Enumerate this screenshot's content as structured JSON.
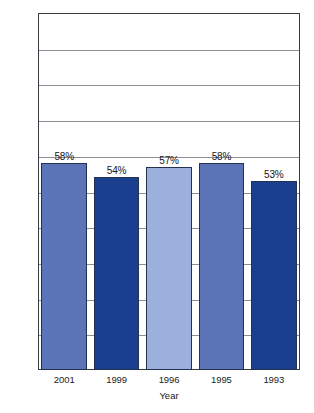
{
  "chart_data": {
    "type": "bar",
    "title": "",
    "xlabel": "Year",
    "ylabel": "",
    "categories": [
      "2001",
      "1999",
      "1996",
      "1995",
      "1993"
    ],
    "values": [
      58,
      54,
      57,
      58,
      53
    ],
    "data_labels": [
      "58%",
      "54%",
      "57%",
      "58%",
      "53%"
    ],
    "bar_colors": [
      "#5B74B8",
      "#1B3F8F",
      "#9CB0DE",
      "#5B74B8",
      "#1B3F8F"
    ],
    "ylim": [
      0,
      100
    ],
    "ytick_labels": [
      "0%",
      "10%",
      "20%",
      "30%",
      "40%",
      "50%",
      "60%",
      "70%",
      "80%",
      "90%",
      "100%"
    ],
    "ytick_values": [
      0,
      10,
      20,
      30,
      40,
      50,
      60,
      70,
      80,
      90,
      100
    ],
    "grid": true,
    "legend": "none",
    "frame_color": "#3A3A42",
    "gridline_color": "#8D8D96",
    "background_color": "#FFFFFF"
  }
}
